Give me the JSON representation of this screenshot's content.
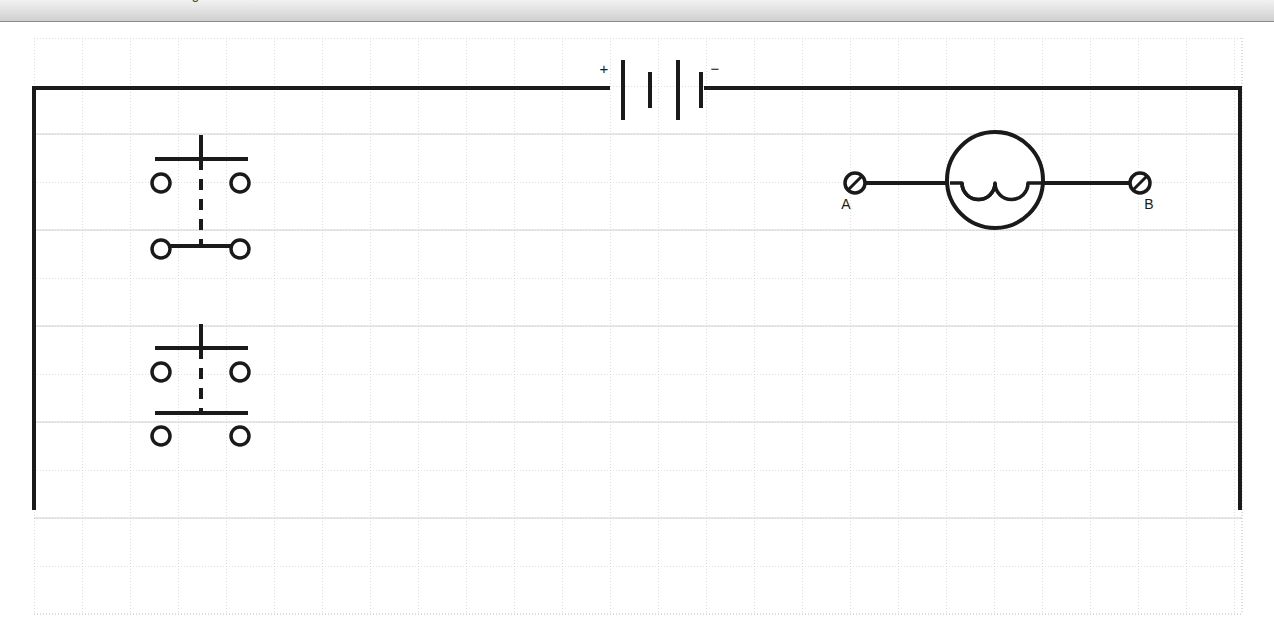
{
  "window": {
    "title": "Circuit Diagram Editor",
    "toolbar_clipped_text": "Drawing"
  },
  "canvas": {
    "background_color": "#ffffff",
    "grid": {
      "visible": true,
      "minor_color": "#c8c8c8",
      "major_color": "#b4b4b4",
      "spacing_px": 48,
      "origin_x": 34,
      "origin_y": 16,
      "cols": 25,
      "rows": 12,
      "style": "dotted"
    },
    "wire_color": "#1a1a1a",
    "wire_width_px": 4
  },
  "circuit": {
    "title": "Series circuit with battery, lamp and two switches",
    "components": [
      {
        "id": "battery",
        "type": "battery",
        "name": "battery-symbol",
        "cells": 2,
        "plus_label": "+",
        "minus_label": "−",
        "orientation": "horizontal",
        "center_x": 662,
        "center_y": 66
      },
      {
        "id": "lamp",
        "type": "lamp",
        "name": "lamp-symbol",
        "label": "",
        "center_x": 995,
        "center_y": 158,
        "radius": 48,
        "filament_arcs": 3
      },
      {
        "id": "terminal-a",
        "type": "terminal",
        "name": "terminal-a",
        "label": "A",
        "center_x": 855,
        "center_y": 161,
        "radius": 10
      },
      {
        "id": "terminal-b",
        "type": "terminal",
        "name": "terminal-b",
        "label": "B",
        "center_x": 1140,
        "center_y": 161,
        "radius": 10
      },
      {
        "id": "switch-1",
        "type": "double-pole-switch",
        "name": "switch-upper",
        "label": "",
        "center_x": 201,
        "top_bar_y": 137,
        "bottom_bar_y": 224,
        "contact_left_x": 161,
        "contact_right_x": 240,
        "upper_contacts_y": 161,
        "lower_contacts_y": 227,
        "contact_radius": 9
      },
      {
        "id": "switch-2",
        "type": "double-pole-switch",
        "name": "switch-lower",
        "label": "",
        "center_x": 201,
        "top_bar_y": 326,
        "bottom_bar_y": 391,
        "contact_left_x": 161,
        "contact_right_x": 240,
        "upper_contacts_y": 350,
        "lower_contacts_y": 414,
        "contact_radius": 9
      }
    ],
    "wires": [
      {
        "id": "wire-top-left",
        "name": "wire-top-left",
        "x1": 34,
        "y1": 66,
        "x2": 600,
        "y2": 66
      },
      {
        "id": "wire-top-right",
        "name": "wire-top-right",
        "x1": 723,
        "y1": 66,
        "x2": 1240,
        "y2": 66
      },
      {
        "id": "wire-left",
        "name": "wire-left",
        "x1": 34,
        "y1": 66,
        "x2": 34,
        "y2": 486
      },
      {
        "id": "wire-right",
        "name": "wire-right",
        "x1": 1240,
        "y1": 66,
        "x2": 1240,
        "y2": 486
      },
      {
        "id": "wire-a-lamp",
        "name": "wire-terminal-a-to-lamp",
        "x1": 865,
        "y1": 161,
        "x2": 948,
        "y2": 161
      },
      {
        "id": "wire-lamp-b",
        "name": "wire-lamp-to-terminal-b",
        "x1": 1043,
        "y1": 161,
        "x2": 1130,
        "y2": 161
      }
    ]
  }
}
